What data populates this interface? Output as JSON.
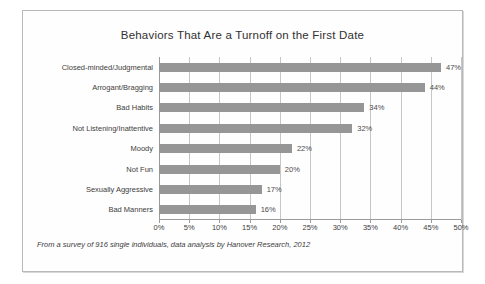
{
  "chart_data": {
    "type": "bar",
    "orientation": "horizontal",
    "title": "Behaviors That Are a Turnoff on the First Date",
    "xlabel": "",
    "ylabel": "",
    "xlim": [
      0,
      50
    ],
    "grid": true,
    "legend": false,
    "bar_color": "#969696",
    "categories": [
      "Closed-minded/Judgmental",
      "Arrogant/Bragging",
      "Bad Habits",
      "Not Listening/Inattentive",
      "Moody",
      "Not Fun",
      "Sexually Aggressive",
      "Bad Manners"
    ],
    "values": [
      47,
      44,
      34,
      32,
      22,
      20,
      17,
      16
    ],
    "data_labels": [
      "47%",
      "44%",
      "34%",
      "32%",
      "22%",
      "20%",
      "17%",
      "16%"
    ],
    "xticks": [
      0,
      5,
      10,
      15,
      20,
      25,
      30,
      35,
      40,
      45,
      50
    ],
    "xticklabels": [
      "0%",
      "5%",
      "10%",
      "15%",
      "20%",
      "25%",
      "30%",
      "35%",
      "40%",
      "45%",
      "50%"
    ],
    "annotation": "From a survey of 916 single individuals, data analysis by Hanover Research, 2012"
  }
}
